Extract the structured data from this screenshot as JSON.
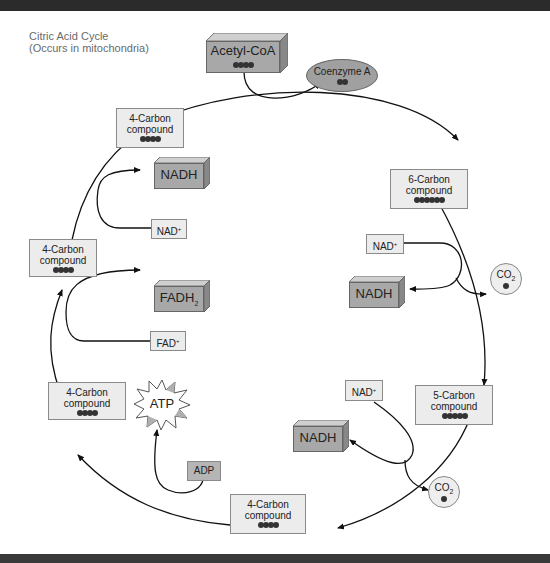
{
  "title": {
    "line1": "Citric Acid Cycle",
    "line2": "(Occurs in mitochondria)"
  },
  "entry": {
    "acetyl_coa": "Acetyl-CoA",
    "acetyl_coa_carbons": 4,
    "coenzyme_a": "Coenzyme A",
    "coenzyme_a_dots": 2
  },
  "compounds": [
    {
      "id": "c4_top",
      "line1": "4-Carbon",
      "line2": "compound",
      "carbons": 4
    },
    {
      "id": "c6",
      "line1": "6-Carbon",
      "line2": "compound",
      "carbons": 6
    },
    {
      "id": "c5",
      "line1": "5-Carbon",
      "line2": "compound",
      "carbons": 5
    },
    {
      "id": "c4_bottom",
      "line1": "4-Carbon",
      "line2": "compound",
      "carbons": 4
    },
    {
      "id": "c4_lowerleft",
      "line1": "4-Carbon",
      "line2": "compound",
      "carbons": 4
    },
    {
      "id": "c4_left",
      "line1": "4-Carbon",
      "line2": "compound",
      "carbons": 4
    }
  ],
  "cofactors": {
    "nadh": "NADH",
    "nad": "NAD",
    "nad_sup": "+",
    "fadh": "FADH",
    "fadh_sub": "2",
    "fad": "FAD",
    "fad_sup": "+",
    "atp": "ATP",
    "adp": "ADP",
    "co2": "CO",
    "co2_sub": "2"
  },
  "colors": {
    "compound_fill": "#ececec",
    "cube_fill": "#a8a8a8",
    "coenzyme_fill": "#a0a0a0",
    "line": "#111111"
  }
}
